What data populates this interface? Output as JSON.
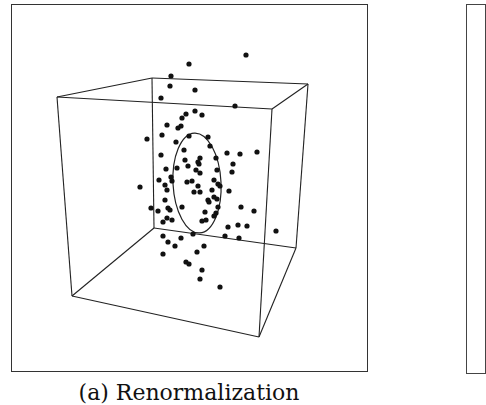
{
  "figure": {
    "caption": "(a) Renormalization",
    "panel_count_visible": 2
  },
  "chart_data": {
    "type": "scatter",
    "title": "",
    "subtitle": "(a) Renormalization",
    "xlabel": "",
    "ylabel": "",
    "grid": false,
    "legend": null,
    "projection": "3d-cube-wireframe",
    "cube": {
      "front": [
        [
          57,
          97
        ],
        [
          272,
          109
        ],
        [
          259,
          337
        ],
        [
          72,
          296
        ]
      ],
      "back": [
        [
          152,
          78
        ],
        [
          308,
          84
        ],
        [
          296,
          248
        ],
        [
          154,
          228
        ]
      ]
    },
    "ellipse": {
      "cx": 197,
      "cy": 183,
      "rx": 24,
      "ry": 50
    },
    "points_screen": [
      [
        246,
        55
      ],
      [
        189,
        64
      ],
      [
        171,
        76
      ],
      [
        170,
        86
      ],
      [
        195,
        90
      ],
      [
        161,
        98
      ],
      [
        235,
        106
      ],
      [
        195,
        111
      ],
      [
        186,
        114
      ],
      [
        182,
        118
      ],
      [
        202,
        115
      ],
      [
        181,
        126
      ],
      [
        167,
        125
      ],
      [
        178,
        128
      ],
      [
        147,
        139
      ],
      [
        162,
        135
      ],
      [
        189,
        136
      ],
      [
        208,
        137
      ],
      [
        210,
        146
      ],
      [
        176,
        142
      ],
      [
        161,
        155
      ],
      [
        184,
        150
      ],
      [
        200,
        158
      ],
      [
        227,
        153
      ],
      [
        240,
        154
      ],
      [
        257,
        152
      ],
      [
        166,
        169
      ],
      [
        185,
        160
      ],
      [
        198,
        162
      ],
      [
        216,
        158
      ],
      [
        233,
        164
      ],
      [
        232,
        172
      ],
      [
        177,
        168
      ],
      [
        188,
        166
      ],
      [
        196,
        170
      ],
      [
        199,
        164
      ],
      [
        200,
        173
      ],
      [
        217,
        170
      ],
      [
        159,
        180
      ],
      [
        171,
        177
      ],
      [
        172,
        181
      ],
      [
        187,
        182
      ],
      [
        192,
        181
      ],
      [
        198,
        186
      ],
      [
        214,
        180
      ],
      [
        218,
        184
      ],
      [
        140,
        187
      ],
      [
        165,
        185
      ],
      [
        167,
        190
      ],
      [
        200,
        192
      ],
      [
        194,
        192
      ],
      [
        212,
        190
      ],
      [
        220,
        186
      ],
      [
        229,
        191
      ],
      [
        214,
        197
      ],
      [
        208,
        200
      ],
      [
        217,
        199
      ],
      [
        165,
        200
      ],
      [
        168,
        208
      ],
      [
        182,
        207
      ],
      [
        209,
        202
      ],
      [
        151,
        208
      ],
      [
        158,
        211
      ],
      [
        170,
        210
      ],
      [
        205,
        212
      ],
      [
        218,
        207
      ],
      [
        216,
        213
      ],
      [
        241,
        207
      ],
      [
        254,
        211
      ],
      [
        167,
        218
      ],
      [
        172,
        220
      ],
      [
        163,
        222
      ],
      [
        202,
        221
      ],
      [
        206,
        220
      ],
      [
        214,
        216
      ],
      [
        228,
        227
      ],
      [
        238,
        225
      ],
      [
        247,
        226
      ],
      [
        276,
        231
      ],
      [
        163,
        236
      ],
      [
        168,
        242
      ],
      [
        175,
        246
      ],
      [
        181,
        238
      ],
      [
        193,
        234
      ],
      [
        204,
        246
      ],
      [
        225,
        236
      ],
      [
        239,
        238
      ],
      [
        163,
        254
      ],
      [
        197,
        252
      ],
      [
        186,
        262
      ],
      [
        189,
        264
      ],
      [
        202,
        270
      ],
      [
        200,
        279
      ],
      [
        220,
        287
      ]
    ]
  }
}
